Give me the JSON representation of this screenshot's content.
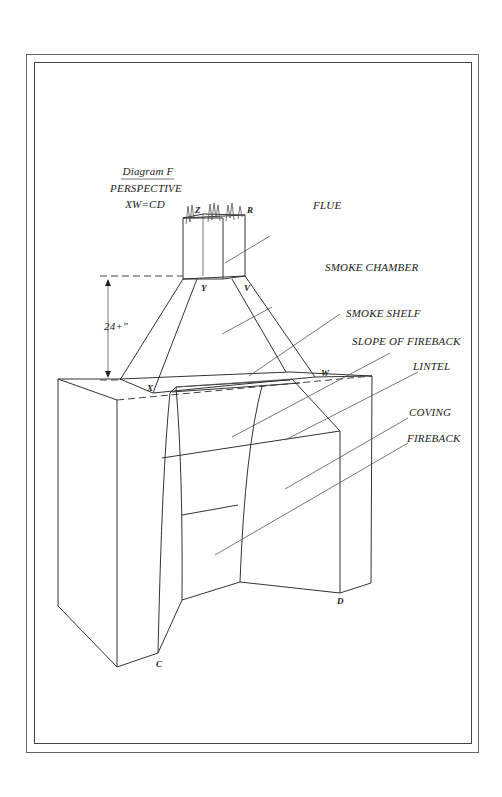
{
  "title": {
    "line1": "Diagram F",
    "line2": "PERSPECTIVE",
    "line3": "XW=CD"
  },
  "dimension": "24+\"",
  "callouts": {
    "flue": "FLUE",
    "smoke_chamber": "SMOKE CHAMBER",
    "smoke_shelf": "SMOKE  SHELF",
    "slope_of_fireback": "SLOPE OF FIREBACK",
    "lintel": "LINTEL",
    "coving": "COVING",
    "fireback": "FIREBACK"
  },
  "points": {
    "z": "Z",
    "r": "R",
    "y": "Y",
    "v": "V",
    "x": "X",
    "w": "W",
    "c": "C",
    "d": "D"
  },
  "colors": {
    "ink": "#333333",
    "paper": "#ffffff",
    "frame": "#555555"
  }
}
